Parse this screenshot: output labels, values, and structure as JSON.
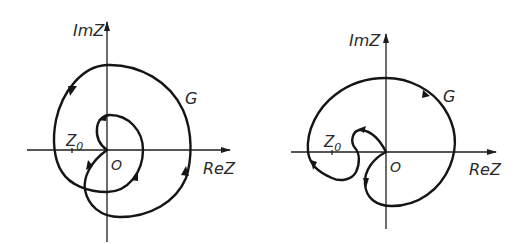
{
  "figures": [
    {
      "id": "left",
      "axis_labels": {
        "imaginary": "ImZ",
        "real": "ReZ"
      },
      "origin_label": "O",
      "point_label": "Z",
      "point_subscript": "0",
      "curve_label": "G",
      "description": "Closed contour G encircling origin twice with inner loop around Z0"
    },
    {
      "id": "right",
      "axis_labels": {
        "imaginary": "ImZ",
        "real": "ReZ"
      },
      "origin_label": "O",
      "point_label": "Z",
      "point_subscript": "0",
      "curve_label": "G",
      "description": "Closed contour G passing through origin with S-shaped indentation near Z0"
    }
  ]
}
